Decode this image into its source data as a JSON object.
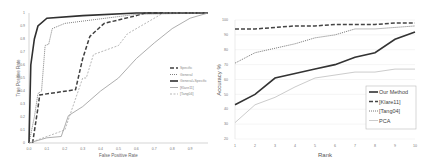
{
  "chart_data": [
    {
      "type": "line",
      "title": "",
      "xlabel": "False Positive Rate",
      "ylabel": "True Positive Rate",
      "xlim": [
        0,
        1
      ],
      "ylim": [
        0,
        1
      ],
      "x_ticks": [
        "0.0",
        "0.1",
        "0.2",
        "0.3",
        "0.4",
        "0.5",
        "0.6",
        "0.7",
        "0.8",
        "0.9"
      ],
      "y_ticks": [
        "0",
        "0.1",
        "0.2",
        "0.3",
        "0.4",
        "0.5",
        "0.6",
        "0.7",
        "0.8",
        "0.9",
        "1"
      ],
      "grid": false,
      "legend_position": "right-middle",
      "series": [
        {
          "name": "Specific",
          "style": "dashed-thick",
          "color": "#404040",
          "points": [
            [
              0.02,
              0
            ],
            [
              0.05,
              0.27
            ],
            [
              0.06,
              0.37
            ],
            [
              0.26,
              0.41
            ],
            [
              0.3,
              0.65
            ],
            [
              0.34,
              0.82
            ],
            [
              0.42,
              0.92
            ],
            [
              0.6,
              0.98
            ],
            [
              0.65,
              1
            ],
            [
              1,
              1
            ]
          ]
        },
        {
          "name": "General",
          "style": "dotted",
          "color": "#808080",
          "points": [
            [
              0,
              0
            ],
            [
              0.03,
              0.2
            ],
            [
              0.05,
              0.38
            ],
            [
              0.07,
              0.4
            ],
            [
              0.09,
              0.75
            ],
            [
              0.11,
              0.76
            ],
            [
              0.13,
              0.88
            ],
            [
              0.2,
              0.92
            ],
            [
              0.6,
              0.99
            ],
            [
              1,
              1
            ]
          ]
        },
        {
          "name": "General+Specific",
          "style": "solid-thick",
          "color": "#303030",
          "points": [
            [
              0,
              0
            ],
            [
              0.01,
              0.6
            ],
            [
              0.03,
              0.8
            ],
            [
              0.05,
              0.9
            ],
            [
              0.1,
              0.96
            ],
            [
              0.3,
              0.98
            ],
            [
              0.6,
              1
            ],
            [
              1,
              1
            ]
          ]
        },
        {
          "name": "[Klare11]",
          "style": "solid-thin",
          "color": "#999999",
          "points": [
            [
              0,
              0
            ],
            [
              0.1,
              0.04
            ],
            [
              0.18,
              0.05
            ],
            [
              0.22,
              0.21
            ],
            [
              0.3,
              0.28
            ],
            [
              0.4,
              0.4
            ],
            [
              0.5,
              0.5
            ],
            [
              0.6,
              0.65
            ],
            [
              0.7,
              0.77
            ],
            [
              0.8,
              0.88
            ],
            [
              0.9,
              0.96
            ],
            [
              1,
              1
            ]
          ]
        },
        {
          "name": "[Tang04]",
          "style": "dashed-thin",
          "color": "#999999",
          "points": [
            [
              0,
              0
            ],
            [
              0.1,
              0.05
            ],
            [
              0.2,
              0.1
            ],
            [
              0.25,
              0.3
            ],
            [
              0.3,
              0.5
            ],
            [
              0.32,
              0.5
            ],
            [
              0.36,
              0.68
            ],
            [
              0.5,
              0.75
            ],
            [
              0.55,
              0.84
            ],
            [
              0.75,
              1
            ],
            [
              1,
              1
            ]
          ]
        }
      ]
    },
    {
      "type": "line",
      "title": "",
      "xlabel": "Rank",
      "ylabel": "Accuracy %",
      "categories": [
        1,
        2,
        3,
        4,
        5,
        6,
        7,
        8,
        9,
        10
      ],
      "ylim": [
        20,
        100
      ],
      "y_ticks": [
        "20",
        "30",
        "40",
        "50",
        "60",
        "70",
        "80",
        "90",
        "100"
      ],
      "grid": true,
      "legend_position": "lower-right",
      "series": [
        {
          "name": "Our Method",
          "style": "solid-thick",
          "color": "#333333",
          "values": [
            43,
            50,
            61,
            64,
            67,
            70,
            75,
            78,
            87,
            92
          ]
        },
        {
          "name": "[Klare11]",
          "style": "dashed-thick",
          "color": "#444444",
          "values": [
            94,
            94,
            95,
            96,
            96,
            97,
            97,
            97,
            98,
            98
          ]
        },
        {
          "name": "[Tang04]",
          "style": "dotted",
          "color": "#777777",
          "values": [
            71,
            78,
            81,
            84,
            88,
            90,
            94,
            94,
            95,
            96
          ]
        },
        {
          "name": "PCA",
          "style": "solid-light",
          "color": "#cccccc",
          "values": [
            31,
            43,
            48,
            55,
            61,
            63,
            65,
            65,
            67,
            67
          ]
        }
      ]
    }
  ]
}
